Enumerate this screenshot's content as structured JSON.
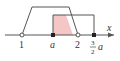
{
  "diagram": {
    "axis_label": "x",
    "ticks": [
      {
        "label": "1",
        "x": 22,
        "marker": "open"
      },
      {
        "label": "a",
        "x": 53,
        "marker": "filled"
      },
      {
        "label": "2",
        "x": 78,
        "marker": "open"
      },
      {
        "label_num": "3",
        "label_den": "2",
        "label_var": "a",
        "x": 94,
        "marker": "filled"
      }
    ],
    "colors": {
      "line": "#555555",
      "shade": "#f4c6c6",
      "axis": "#555555"
    }
  }
}
